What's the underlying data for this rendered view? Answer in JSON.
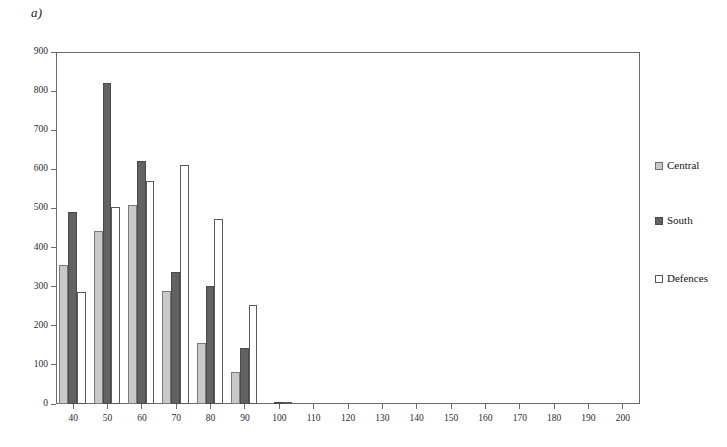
{
  "figure": {
    "panel_label": "a)"
  },
  "legend": {
    "position": "right",
    "entries": [
      {
        "name": "Central",
        "swatch": "central",
        "color": "#c9c9c9"
      },
      {
        "name": "South",
        "swatch": "south",
        "color": "#626262"
      },
      {
        "name": "Defences",
        "swatch": "defences",
        "color": "#ffffff"
      }
    ]
  },
  "axes": {
    "y_ticks": [
      "0",
      "100",
      "200",
      "300",
      "400",
      "500",
      "600",
      "700",
      "800",
      "900"
    ],
    "x_ticks": [
      "40",
      "50",
      "60",
      "70",
      "80",
      "90",
      "100",
      "110",
      "120",
      "130",
      "140",
      "150",
      "160",
      "170",
      "180",
      "190",
      "200"
    ]
  },
  "chart_data": {
    "type": "bar",
    "title": "a)",
    "xlabel": "",
    "ylabel": "",
    "xlim": [
      35,
      205
    ],
    "ylim": [
      0,
      900
    ],
    "ytick_step": 100,
    "xtick_step": 10,
    "grid": false,
    "legend_position": "right",
    "categories": [
      "40",
      "50",
      "60",
      "70",
      "80",
      "90",
      "100",
      "110",
      "120",
      "130",
      "140",
      "150",
      "160",
      "170",
      "180",
      "190",
      "200"
    ],
    "series": [
      {
        "name": "Central",
        "color": "#c9c9c9",
        "values": [
          355,
          443,
          508,
          288,
          157,
          82,
          0,
          0,
          0,
          0,
          0,
          0,
          0,
          0,
          0,
          0,
          0
        ]
      },
      {
        "name": "South",
        "color": "#626262",
        "values": [
          492,
          820,
          622,
          338,
          303,
          143,
          5,
          0,
          0,
          0,
          0,
          0,
          0,
          0,
          0,
          0,
          0
        ]
      },
      {
        "name": "Defences",
        "color": "#ffffff",
        "values": [
          287,
          505,
          570,
          612,
          473,
          253,
          3,
          0,
          0,
          0,
          0,
          0,
          0,
          0,
          0,
          0,
          0
        ]
      }
    ]
  }
}
